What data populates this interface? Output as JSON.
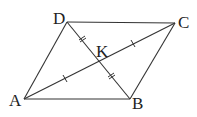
{
  "diagram": {
    "type": "parallelogram-with-diagonals",
    "points": {
      "A": {
        "label": "A",
        "x": 24,
        "y": 99
      },
      "B": {
        "label": "B",
        "x": 130,
        "y": 99
      },
      "C": {
        "label": "C",
        "x": 175,
        "y": 23
      },
      "D": {
        "label": "D",
        "x": 67,
        "y": 22
      },
      "K": {
        "label": "K",
        "x": 99,
        "y": 61
      }
    },
    "edges": [
      "AB",
      "BC",
      "CD",
      "DA"
    ],
    "diagonals": [
      "AC",
      "BD"
    ],
    "equal_marks": {
      "single": [
        "AK",
        "KC"
      ],
      "double": [
        "DK",
        "KB"
      ]
    },
    "colors": {
      "stroke": "#333333",
      "label": "#222222",
      "background": "#ffffff"
    }
  }
}
